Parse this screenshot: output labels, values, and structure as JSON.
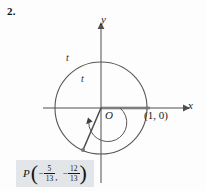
{
  "problem": {
    "number": "2."
  },
  "figure": {
    "type": "unit-circle-diagram",
    "axes": {
      "x_label": "x",
      "y_label": "y",
      "origin_label": "O"
    },
    "labels": {
      "arc_outer": "t",
      "arc_inner": "t",
      "unit_point": "(1, 0)"
    },
    "point": {
      "name": "P",
      "open_paren": "(",
      "close_paren": ")",
      "comma": ",",
      "x": {
        "sign": "−",
        "numerator": "5",
        "denominator": "13"
      },
      "y": {
        "sign": "−",
        "numerator": "12",
        "denominator": "13"
      }
    },
    "geometry": {
      "center_x": 101,
      "center_y": 108,
      "outer_radius": 46,
      "inner_radius": 19,
      "terminal_point_x": 83,
      "terminal_point_y": 150
    },
    "colors": {
      "curve": "#555555",
      "axis": "#5a5a5a",
      "axis_highlight": "#a8a8a8",
      "label_box": "#e3e6e8",
      "text": "#1a1a1a"
    }
  }
}
